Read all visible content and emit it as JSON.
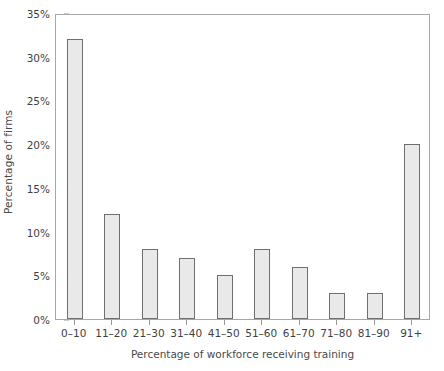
{
  "chart_data": {
    "type": "bar",
    "title": "",
    "xlabel": "Percentage of workforce receiving training",
    "ylabel": "Percentage of firms",
    "categories": [
      "0–10",
      "11–20",
      "21–30",
      "31–40",
      "41–50",
      "51–60",
      "61–70",
      "71–80",
      "81–90",
      "91+"
    ],
    "values": [
      32,
      12,
      8,
      7,
      5,
      8,
      6,
      3,
      3,
      20
    ],
    "value_suffix": "%",
    "ylim": [
      0,
      35
    ],
    "ytick_values": [
      0,
      5,
      10,
      15,
      20,
      25,
      30,
      35
    ],
    "ytick_labels": [
      "0%",
      "5%",
      "10%",
      "15%",
      "20%",
      "25%",
      "30%",
      "35%"
    ],
    "grid": false,
    "legend": null,
    "bar_fill_color": "#e9e9e9",
    "bar_border_color": "#6f6f6f",
    "axis_color": "#a8a8a8",
    "text_color": "#3f3f3f"
  }
}
